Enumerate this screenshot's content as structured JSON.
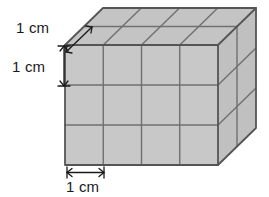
{
  "figure": {
    "shape": "rectangular-prism",
    "units_across_width": 4,
    "units_across_height": 3,
    "units_across_depth": 2,
    "total_unit_cubes": 24
  },
  "labels": {
    "depth": "1 cm",
    "height": "1 cm",
    "width": "1 cm"
  },
  "colors": {
    "face_front": "#c8c8c8",
    "face_top": "#c4c4c4",
    "face_right": "#c0c0c0",
    "outline": "#555555",
    "gridline": "#707070",
    "dimension_line": "#1a1a1a",
    "text": "#1a1a1a",
    "background": "#ffffff"
  },
  "geometry": {
    "front_left_x": 65,
    "front_right_x": 218,
    "front_top_y": 45,
    "front_bottom_y": 165,
    "depth_dx": 38,
    "depth_dy": -37,
    "cell_width": 38.25,
    "cell_height": 40
  },
  "icons": {
    "arrow_depth": "diagonal-double-arrow",
    "arrow_height": "vertical-double-arrow",
    "arrow_width": "horizontal-double-arrow"
  }
}
